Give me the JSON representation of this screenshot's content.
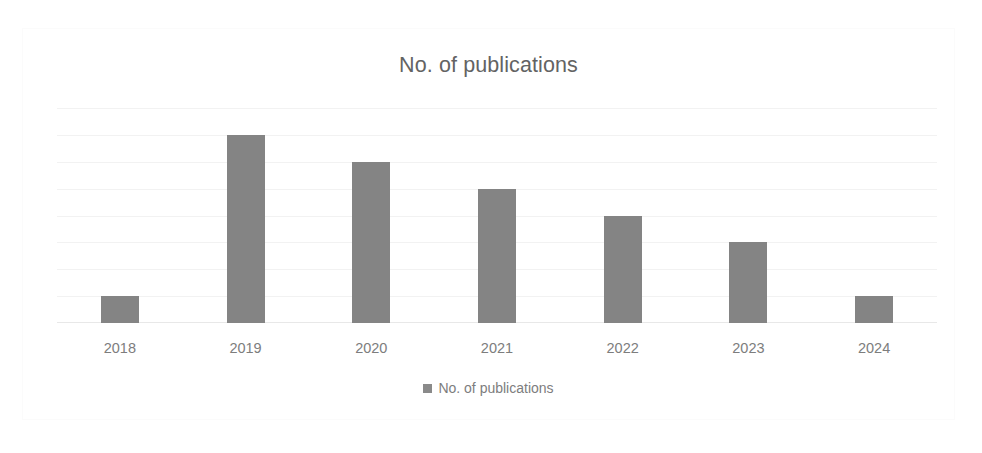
{
  "chart_data": {
    "type": "bar",
    "title": "No. of publications",
    "xlabel": "",
    "ylabel": "",
    "categories": [
      "2018",
      "2019",
      "2020",
      "2021",
      "2022",
      "2023",
      "2024"
    ],
    "values": [
      1,
      7,
      6,
      5,
      4,
      3,
      1
    ],
    "series": [
      {
        "name": "No. of publications",
        "values": [
          1,
          7,
          6,
          5,
          4,
          3,
          1
        ]
      }
    ],
    "ylim": [
      0,
      8
    ],
    "y_ticks": [
      "0",
      "1",
      "2",
      "3",
      "4",
      "5",
      "6",
      "7",
      "8"
    ],
    "grid": true,
    "grid_axis": "y",
    "legend": {
      "position": "bottom",
      "entries": [
        {
          "label": "No. of publications",
          "marker": "legend-square-marker",
          "color": "#848484"
        }
      ]
    },
    "colors": {
      "bar": "#848484",
      "title_text": "#636363",
      "axis_text": "#7d7d7d",
      "gridline": "#f2f2f2",
      "background": "#ffffff",
      "frame_border": "#fbfbfb"
    }
  }
}
